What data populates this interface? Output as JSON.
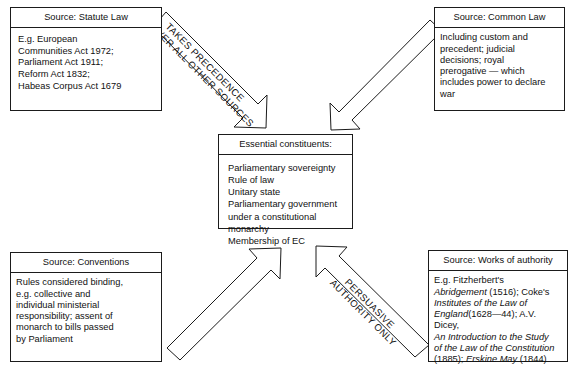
{
  "diagram": {
    "boxes": {
      "statute": {
        "header": "Source: Statute Law",
        "body": "E.g. European\nCommunities Act 1972;\nParliament Act 1911;\nReform Act 1832;\nHabeas Corpus Act 1679"
      },
      "common": {
        "header": "Source: Common Law",
        "body": "Including custom and\nprecedent; judicial\ndecisions; royal\nprerogative — which\nincludes power to declare\nwar"
      },
      "center": {
        "header": "Essential constituents:",
        "body": "Parliamentary sovereignty\nRule of law\nUnitary state\nParliamentary government\nunder a constitutional\nmonarchy\nMembership of EC"
      },
      "conventions": {
        "header": "Source:\nConventions",
        "body": "Rules considered binding,\ne.g. collective and\nindividual ministerial\nresponsibility; assent of\nmonarch to bills passed\nby Parliament"
      },
      "authority": {
        "header": "Source:\nWorks of authority",
        "body_runs": [
          {
            "text": "E.g. Fitzherbert's",
            "italic": false
          },
          {
            "text": "Abridgement",
            "italic": true
          },
          {
            "text": " (1516); Coke's",
            "italic": false
          },
          {
            "text": "Institutes of the Law of England",
            "italic": true
          },
          {
            "text": " (1628—44); A.V. Dicey,",
            "italic": false
          },
          {
            "text": "An Introduction to the Study of the Law of the Constitution",
            "italic": true
          },
          {
            "text": " (1885); ",
            "italic": false
          },
          {
            "text": "Erskine May",
            "italic": true
          },
          {
            "text": " (1844)",
            "italic": false
          }
        ],
        "line1": "E.g. Fitzherbert's",
        "line2_italic": "Abridgement",
        "line2_rest": " (1516); Coke's",
        "line3_italic": "Institutes of the Law of",
        "line4_italic": "England",
        "line4_rest": "(1628—44); A.V. Dicey,",
        "line5_italic": "An Introduction to the Study",
        "line6_italic": "of the Law of the Constitution",
        "line7_pre": "(1885); ",
        "line7_italic": "Erskine May",
        "line7_post": " (1844)"
      }
    },
    "arrow_labels": {
      "top_left_line1": "TAKES PRECEDENCE",
      "top_left_line2": "OVER ALL OTHER SOURCES",
      "bottom_right_line1": "PERSUASIVE",
      "bottom_right_line2": "AUTHORITY ONLY"
    },
    "colors": {
      "stroke": "#1b1b1b",
      "text": "#111111",
      "background": "#ffffff"
    }
  }
}
